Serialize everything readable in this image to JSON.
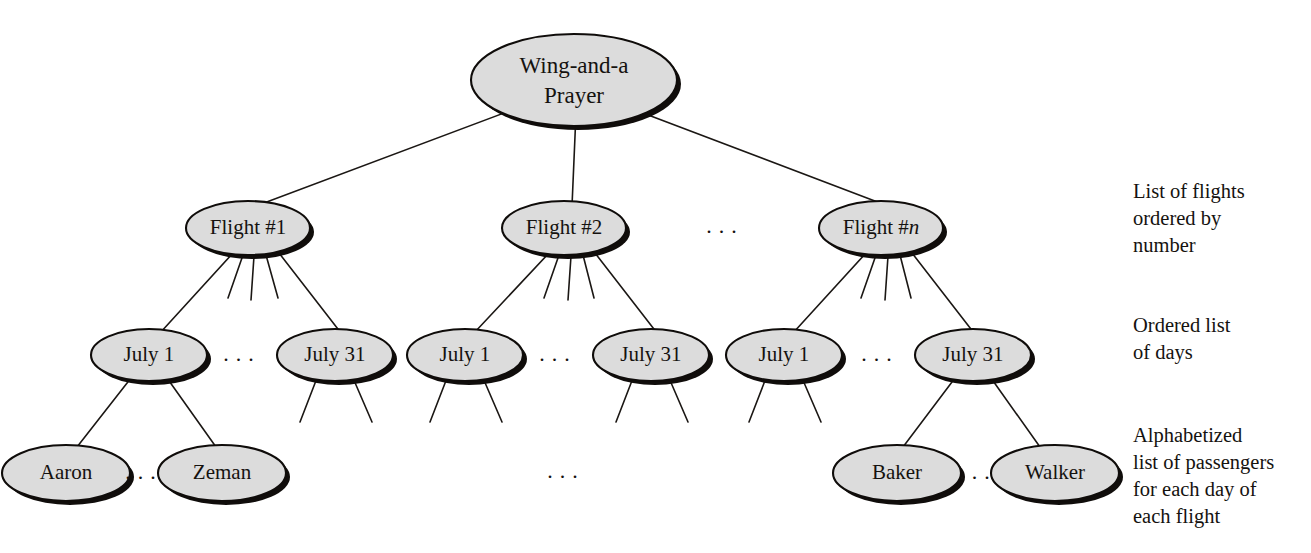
{
  "diagram": {
    "title_node": {
      "label_line1": "Wing-and-a",
      "label_line2": "Prayer"
    },
    "level_flights": [
      {
        "id": "flight1",
        "label_main": "Flight #1",
        "label_italic": ""
      },
      {
        "id": "flight2",
        "label_main": "Flight #2",
        "label_italic": ""
      },
      {
        "id": "flightn",
        "label_main": "Flight #",
        "label_italic": "n"
      }
    ],
    "level_days": [
      {
        "id": "f1d1",
        "label": "July 1"
      },
      {
        "id": "f1d31",
        "label": "July 31"
      },
      {
        "id": "f2d1",
        "label": "July 1"
      },
      {
        "id": "f2d31",
        "label": "July 31"
      },
      {
        "id": "fnd1",
        "label": "July 1"
      },
      {
        "id": "fnd31",
        "label": "July 31"
      }
    ],
    "level_passengers": [
      {
        "id": "pax_aaron",
        "label": "Aaron"
      },
      {
        "id": "pax_zeman",
        "label": "Zeman"
      },
      {
        "id": "pax_baker",
        "label": "Baker"
      },
      {
        "id": "pax_walker",
        "label": "Walker"
      }
    ],
    "ellipses_markers": [
      {
        "id": "flight-row-ellipsis",
        "text": "..."
      },
      {
        "id": "f1-days-ellipsis",
        "text": "..."
      },
      {
        "id": "f2-days-ellipsis",
        "text": "..."
      },
      {
        "id": "fn-days-ellipsis",
        "text": "..."
      },
      {
        "id": "left-pax-ellipsis",
        "text": "..."
      },
      {
        "id": "center-pax-ellipsis",
        "text": "..."
      },
      {
        "id": "right-pax-ellipsis",
        "text": "..."
      }
    ],
    "annotations": [
      {
        "id": "annotation-flights",
        "text": "List of flights\nordered by\nnumber"
      },
      {
        "id": "annotation-days",
        "text": "Ordered list\nof days"
      },
      {
        "id": "annotation-passengers",
        "text": "Alphabetized\nlist of passengers\nfor each day of\neach flight"
      }
    ],
    "colors": {
      "node_fill": "#dcdcdc",
      "node_stroke": "#0f0c0a",
      "edge": "#1b1714",
      "text": "#15120f",
      "background": "#ffffff"
    }
  }
}
